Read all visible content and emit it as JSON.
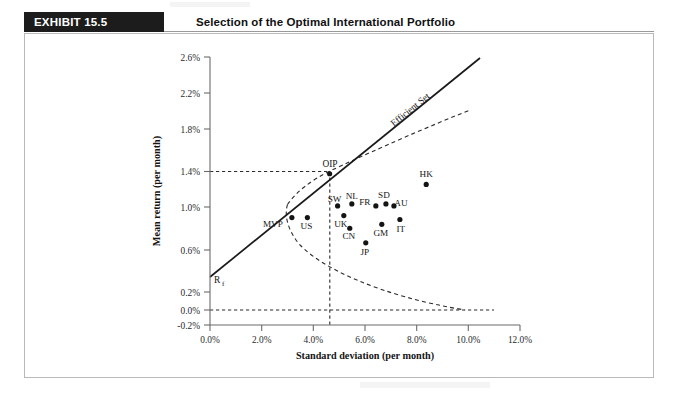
{
  "header": {
    "badge_label": "EXHIBIT 15.5",
    "title": "Selection of the Optimal International Portfolio"
  },
  "chart_data": {
    "type": "scatter",
    "title": "Selection of the Optimal International Portfolio",
    "xlabel": "Standard deviation (per month)",
    "ylabel": "Mean return (per month)",
    "xlim": [
      0.0,
      12.0
    ],
    "ylim": [
      -0.2,
      2.6
    ],
    "grid": false,
    "legend": false,
    "xticks": [
      "0.0%",
      "2.0%",
      "4.0%",
      "6.0%",
      "8.0%",
      "10.0%",
      "12.0%"
    ],
    "xtick_values": [
      0.0,
      2.0,
      4.0,
      6.0,
      8.0,
      10.0,
      12.0
    ],
    "yticks": [
      "2.6%",
      "2.2%",
      "1.8%",
      "1.4%",
      "1.0%",
      "0.6%",
      "0.2%",
      "0.0%",
      "-0.2%"
    ],
    "ytick_values": [
      2.6,
      2.2,
      1.8,
      1.4,
      1.0,
      0.6,
      0.2,
      0.0,
      -0.2
    ],
    "points": [
      {
        "label": "MVP",
        "x": 3.17,
        "y": 0.95,
        "label_dx": -19,
        "label_dy": 9
      },
      {
        "label": "US",
        "x": 3.77,
        "y": 0.95,
        "label_dx": -1,
        "label_dy": 11
      },
      {
        "label": "SW",
        "x": 4.94,
        "y": 1.07,
        "label_dx": -3,
        "label_dy": -4
      },
      {
        "label": "UK",
        "x": 5.18,
        "y": 0.97,
        "label_dx": -3,
        "label_dy": 11
      },
      {
        "label": "NL",
        "x": 5.49,
        "y": 1.09,
        "label_dx": 0,
        "label_dy": -5
      },
      {
        "label": "CN",
        "x": 5.41,
        "y": 0.84,
        "label_dx": -1,
        "label_dy": 11
      },
      {
        "label": "FR",
        "x": 6.42,
        "y": 1.07,
        "label_dx": -11,
        "label_dy": -1
      },
      {
        "label": "SD",
        "x": 6.81,
        "y": 1.09,
        "label_dx": -2,
        "label_dy": -6
      },
      {
        "label": "AU",
        "x": 7.12,
        "y": 1.07,
        "label_dx": 7,
        "label_dy": 0
      },
      {
        "label": "GM",
        "x": 6.65,
        "y": 0.88,
        "label_dx": -1,
        "label_dy": 12
      },
      {
        "label": "IT",
        "x": 7.35,
        "y": 0.93,
        "label_dx": 1,
        "label_dy": 12
      },
      {
        "label": "JP",
        "x": 6.03,
        "y": 0.69,
        "label_dx": -1,
        "label_dy": 12
      },
      {
        "label": "HK",
        "x": 8.37,
        "y": 1.29,
        "label_dx": 0,
        "label_dy": -7
      }
    ],
    "annotations": [
      {
        "name": "oip",
        "label": "OIP",
        "x": 4.63,
        "y": 1.4
      },
      {
        "name": "risk-free-rate",
        "label": "Rf",
        "x": 0.0,
        "y": 0.38
      },
      {
        "name": "efficient-set",
        "label": "Efficient Set",
        "x": 7.6,
        "y": 2.05
      }
    ],
    "lines": [
      {
        "name": "capital-market-line",
        "style": "solid",
        "from": {
          "x": 0.0,
          "y": 0.36
        },
        "to": {
          "x": 10.45,
          "y": 2.6
        }
      },
      {
        "name": "minimum-variance-frontier",
        "style": "dashed"
      },
      {
        "name": "oip-vertical-guide",
        "style": "dashed",
        "x": 4.63,
        "y_from": -0.2,
        "y_to": 1.4
      },
      {
        "name": "oip-horizontal-guide",
        "style": "dashed",
        "y": 1.32,
        "x_from": 0.0,
        "x_to": 4.63
      },
      {
        "name": "zero-return-guide",
        "style": "dashed",
        "y": 0.0,
        "x_from": 0.0,
        "x_to": 11.0
      }
    ],
    "colors": {
      "line": "#1a1a1a",
      "dashed": "#2b2b2b",
      "point": "#141414",
      "axis": "#6b6b6b",
      "badge_bg": "#1c1c1c",
      "badge_text": "#ffffff"
    }
  }
}
